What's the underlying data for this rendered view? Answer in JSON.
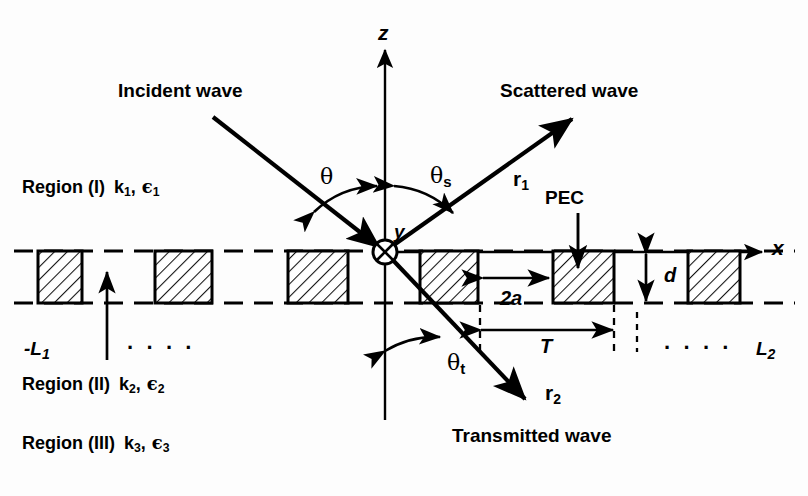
{
  "figure": {
    "background_color": "#fdfdfd",
    "stroke_color": "#000000"
  },
  "axes": {
    "z_label": "z",
    "x_label": "x",
    "y_label": "y",
    "origin_marker": "circle-cross-icon"
  },
  "waves": {
    "incident_label": "Incident wave",
    "scattered_label": "Scattered wave",
    "transmitted_label": "Transmitted wave"
  },
  "rays": {
    "r1_label": "r",
    "r1_sub": "1",
    "r2_label": "r",
    "r2_sub": "2"
  },
  "angles": {
    "theta": "θ",
    "theta_s_base": "θ",
    "theta_s_sub": "s",
    "theta_t_base": "θ",
    "theta_t_sub": "t"
  },
  "regions": [
    {
      "name": "Region (I)",
      "k": "k",
      "k_sub": "1",
      "eps": "ϵ",
      "eps_sub": "1"
    },
    {
      "name": "Region (II)",
      "k": "k",
      "k_sub": "2",
      "eps": "ϵ",
      "eps_sub": "2"
    },
    {
      "name": "Region (III)",
      "k": "k",
      "k_sub": "3",
      "eps": "ϵ",
      "eps_sub": "3"
    }
  ],
  "dimensions": {
    "gap_label": "2a",
    "period_label": "T",
    "thickness_label": "d",
    "left_extent": "-L",
    "left_extent_sub": "1",
    "right_extent": "L",
    "right_extent_sub": "2"
  },
  "annotations": {
    "pec_label": "PEC",
    "ellipsis_left": "·  ·  ·  ·",
    "ellipsis_right": "·  ·  ·  ·"
  },
  "geometry": {
    "slab_top_y": 251,
    "slab_bottom_y": 303,
    "origin_x": 385,
    "origin_y": 252,
    "period_px": 134,
    "strips": [
      {
        "x": 38,
        "width": 44
      },
      {
        "x": 155,
        "width": 57
      },
      {
        "x": 288,
        "width": 60
      },
      {
        "x": 420,
        "width": 58
      },
      {
        "x": 553,
        "width": 61
      },
      {
        "x": 688,
        "width": 52
      }
    ]
  }
}
